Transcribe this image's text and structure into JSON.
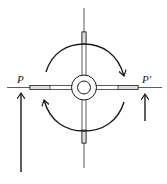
{
  "diagram": {
    "type": "capstan-torque-couple",
    "labels": {
      "left_point": "P",
      "right_point": "P'"
    },
    "elements": {
      "hub": "central-hub",
      "spokes": [
        "top-spoke",
        "bottom-spoke",
        "left-spoke",
        "right-spoke"
      ],
      "rotation_arrows": [
        "top-arc-clockwise",
        "bottom-arc-clockwise"
      ],
      "force_arrows": [
        "left-force-up-long",
        "right-force-up-short"
      ]
    },
    "colors": {
      "stroke": "#1a1a1a",
      "background": "#ffffff"
    }
  }
}
